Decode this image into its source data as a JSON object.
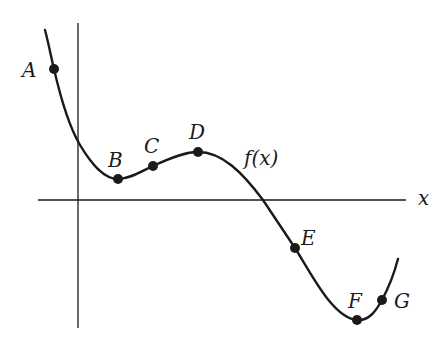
{
  "diagram": {
    "function_label": "f(x)",
    "x_axis_label": "x",
    "colors": {
      "stroke": "#1a1a1a",
      "background": "#ffffff"
    },
    "points": [
      {
        "id": "A",
        "label": "A",
        "x": 54,
        "y": 69,
        "label_x": 22,
        "label_y": 60
      },
      {
        "id": "B",
        "label": "B",
        "x": 118,
        "y": 179,
        "label_x": 108,
        "label_y": 150
      },
      {
        "id": "C",
        "label": "C",
        "x": 153,
        "y": 166,
        "label_x": 144,
        "label_y": 136
      },
      {
        "id": "D",
        "label": "D",
        "x": 198,
        "y": 152,
        "label_x": 189,
        "label_y": 122
      },
      {
        "id": "E",
        "label": "E",
        "x": 295,
        "y": 248,
        "label_x": 301,
        "label_y": 228
      },
      {
        "id": "F",
        "label": "F",
        "x": 357,
        "y": 320,
        "label_x": 348,
        "label_y": 291
      },
      {
        "id": "G",
        "label": "G",
        "x": 382,
        "y": 300,
        "label_x": 394,
        "label_y": 291
      }
    ]
  }
}
